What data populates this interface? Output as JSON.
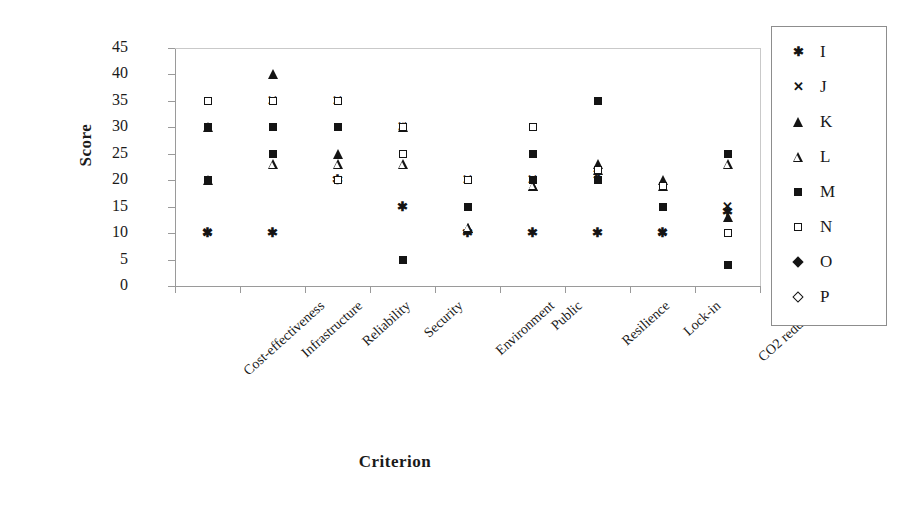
{
  "chart_data": {
    "type": "scatter",
    "title": "",
    "xlabel": "Criterion",
    "ylabel": "Score",
    "ylim": [
      0,
      45
    ],
    "yticks": [
      0,
      5,
      10,
      15,
      20,
      25,
      30,
      35,
      40,
      45
    ],
    "grid": false,
    "legend_position": "right",
    "categories": [
      "Cost-effectiveness",
      "Infrastructure",
      "Reliability",
      "Security",
      "Environment",
      "Public",
      "Resilience",
      "Lock-in",
      "CO2 reduction"
    ],
    "series": [
      {
        "name": "I",
        "marker": "asterisk",
        "values": [
          10,
          10,
          20,
          15,
          10,
          10,
          10,
          10,
          14
        ]
      },
      {
        "name": "J",
        "marker": "cross",
        "values": [
          10,
          35,
          35,
          30,
          20,
          20,
          21,
          10,
          15
        ]
      },
      {
        "name": "K",
        "marker": "triangle-filled",
        "values": [
          30,
          40,
          25,
          30,
          11,
          19,
          23,
          20,
          13
        ]
      },
      {
        "name": "L",
        "marker": "triangle-open",
        "values": [
          20,
          23,
          23,
          23,
          11,
          19,
          22,
          19,
          23
        ]
      },
      {
        "name": "M",
        "marker": "square-filled",
        "values": [
          30,
          25,
          30,
          25,
          15,
          25,
          35,
          15,
          25
        ]
      },
      {
        "name": "N",
        "marker": "square-open",
        "values": [
          20,
          35,
          20,
          25,
          20,
          20,
          20,
          15,
          10
        ]
      },
      {
        "name": "O",
        "marker": "diamond-filled",
        "values": [
          20,
          30,
          30,
          5,
          15,
          20,
          20,
          15,
          4
        ]
      },
      {
        "name": "P",
        "marker": "diamond-open",
        "values": [
          35,
          35,
          35,
          30,
          20,
          30,
          22,
          19,
          10
        ]
      }
    ]
  },
  "legend": {
    "entries": [
      {
        "label": "I",
        "marker": "asterisk"
      },
      {
        "label": "J",
        "marker": "cross"
      },
      {
        "label": "K",
        "marker": "triangle-filled"
      },
      {
        "label": "L",
        "marker": "triangle-open"
      },
      {
        "label": "M",
        "marker": "square-filled"
      },
      {
        "label": "N",
        "marker": "square-open"
      },
      {
        "label": "O",
        "marker": "diamond-filled"
      },
      {
        "label": "P",
        "marker": "diamond-open"
      }
    ]
  },
  "colors": {
    "marker": "#141414",
    "axis": "#9a9a9a",
    "frame": "#c9c9c9",
    "background": "#ffffff",
    "text": "#1a1a1a"
  }
}
